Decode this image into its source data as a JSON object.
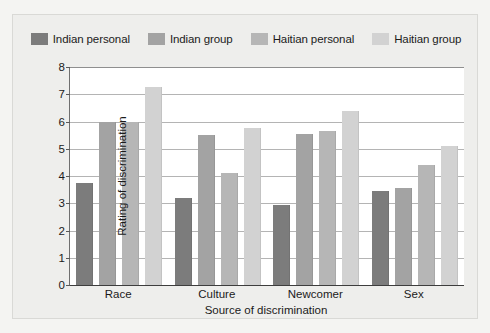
{
  "chart_data": {
    "type": "bar",
    "title": "",
    "xlabel": "Source of discrimination",
    "ylabel": "Rating of discrimination",
    "categories": [
      "Race",
      "Culture",
      "Newcomer",
      "Sex"
    ],
    "series": [
      {
        "name": "Indian personal",
        "color": "#7c7c7c",
        "values": [
          3.75,
          3.2,
          2.95,
          3.45
        ]
      },
      {
        "name": "Indian group",
        "color": "#a3a3a3",
        "values": [
          6.0,
          5.5,
          5.55,
          3.55
        ]
      },
      {
        "name": "Haitian personal",
        "color": "#b6b6b6",
        "values": [
          6.0,
          4.1,
          5.65,
          4.4
        ]
      },
      {
        "name": "Haitian group",
        "color": "#d2d2d2",
        "values": [
          7.25,
          5.75,
          6.4,
          5.1
        ]
      }
    ],
    "ylim": [
      0,
      8
    ],
    "ytick_labels": [
      "8",
      "7",
      "6",
      "5",
      "4",
      "3",
      "2",
      "1",
      "0"
    ],
    "ytick_values": [
      8,
      7,
      6,
      5,
      4,
      3,
      2,
      1,
      0
    ],
    "grid": true,
    "legend_position": "top"
  }
}
